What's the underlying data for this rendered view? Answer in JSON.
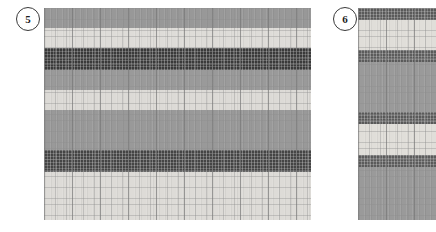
{
  "figure": {
    "background_color": "#ffffff",
    "width": 436,
    "height": 232
  },
  "panels": [
    {
      "id": "panel-5",
      "badge_label": "5",
      "badge": {
        "x": 16,
        "y": 7,
        "size": 24
      },
      "rect": {
        "x": 44,
        "y": 8,
        "width": 267,
        "height": 212
      },
      "grid": {
        "minor_cell_px": 5.6,
        "major_cell_px": 28,
        "minor_color": "#8d8d8d",
        "major_color": "#6e6e6e",
        "minor_opacity": 0.38,
        "major_opacity": 0.5
      },
      "bands": [
        {
          "name": "band-mid-gray-1",
          "top": 0,
          "height": 20,
          "color": "#989898",
          "textured": false
        },
        {
          "name": "band-light-1",
          "top": 20,
          "height": 20,
          "color": "#dedcd8",
          "textured": false
        },
        {
          "name": "band-dark-1",
          "top": 40,
          "height": 22,
          "color": "#3a3a3a",
          "textured": true
        },
        {
          "name": "band-mid-gray-2",
          "top": 62,
          "height": 20,
          "color": "#9a9a9a",
          "textured": false
        },
        {
          "name": "band-light-2",
          "top": 82,
          "height": 20,
          "color": "#dcdad6",
          "textured": false
        },
        {
          "name": "band-mid-gray-3",
          "top": 102,
          "height": 40,
          "color": "#999999",
          "textured": false
        },
        {
          "name": "band-dark-2",
          "top": 142,
          "height": 22,
          "color": "#454545",
          "textured": true
        },
        {
          "name": "band-light-3",
          "top": 164,
          "height": 48,
          "color": "#dddbd7",
          "textured": false
        }
      ]
    },
    {
      "id": "panel-6",
      "badge_label": "6",
      "badge": {
        "x": 333,
        "y": 7,
        "size": 24
      },
      "rect": {
        "x": 358,
        "y": 8,
        "width": 78,
        "height": 212
      },
      "grid": {
        "minor_cell_px": 5.6,
        "major_cell_px": 28,
        "minor_color": "#8d8d8d",
        "major_color": "#6e6e6e",
        "minor_opacity": 0.38,
        "major_opacity": 0.5
      },
      "bands": [
        {
          "name": "band-dark-1",
          "top": 0,
          "height": 12,
          "color": "#5a5a5a",
          "textured": true
        },
        {
          "name": "band-light-1",
          "top": 12,
          "height": 30,
          "color": "#e0ded9",
          "textured": false
        },
        {
          "name": "band-dark-2",
          "top": 42,
          "height": 12,
          "color": "#5c5c5c",
          "textured": true
        },
        {
          "name": "band-mid-gray-1",
          "top": 54,
          "height": 50,
          "color": "#9a9a9a",
          "textured": false
        },
        {
          "name": "band-dark-3",
          "top": 104,
          "height": 12,
          "color": "#5a5a5a",
          "textured": true
        },
        {
          "name": "band-light-2",
          "top": 116,
          "height": 31,
          "color": "#e0ded9",
          "textured": false
        },
        {
          "name": "band-dark-4",
          "top": 147,
          "height": 12,
          "color": "#5c5c5c",
          "textured": true
        },
        {
          "name": "band-mid-gray-2",
          "top": 159,
          "height": 53,
          "color": "#9a9a9a",
          "textured": false
        }
      ]
    }
  ]
}
